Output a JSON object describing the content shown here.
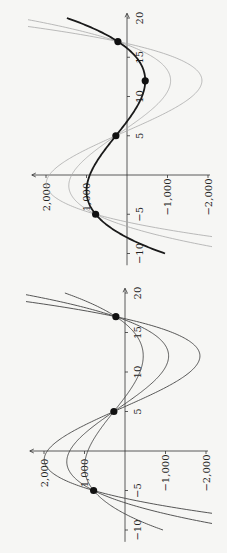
{
  "figure": {
    "background": "#f6f6f4",
    "orientation": "rotated 90 degrees clockwise on page",
    "panels": [
      "left",
      "right"
    ]
  },
  "chart_data": [
    {
      "type": "line",
      "panel": "top-of-page (right panel when upright)",
      "title": "",
      "xlabel": "",
      "ylabel": "",
      "xlim": [
        -10,
        20
      ],
      "ylim": [
        -2000,
        2000
      ],
      "x_ticks": [
        "-10",
        "-5",
        "5",
        "10",
        "15",
        "20"
      ],
      "y_ticks": [
        "2,000",
        "1,000",
        "-1,000",
        "-2,000"
      ],
      "grid": false,
      "series": [
        {
          "name": "cubic c=3.4",
          "color": "#aaaaaa",
          "width": 0.8,
          "c": 3.4
        },
        {
          "name": "cubic c=2.1",
          "color": "#aaaaaa",
          "width": 0.8,
          "c": 2.1
        },
        {
          "name": "cubic through 4 points",
          "color": "#1a1a1a",
          "width": 1.8,
          "c": 1.047,
          "xrange": [
            -10,
            20
          ]
        }
      ],
      "points": [
        {
          "x": -5,
          "y": 775
        },
        {
          "x": 5,
          "y": 275
        },
        {
          "x": 12,
          "y": -450
        },
        {
          "x": 17,
          "y": 225
        }
      ]
    },
    {
      "type": "line",
      "panel": "bottom-of-page (left panel when upright)",
      "title": "",
      "xlabel": "",
      "ylabel": "",
      "xlim": [
        -10,
        20
      ],
      "ylim": [
        -2000,
        2000
      ],
      "x_ticks": [
        "-10",
        "-5",
        "5",
        "10",
        "15",
        "20"
      ],
      "y_ticks": [
        "2,000",
        "1,000",
        "-1,000",
        "-2,000"
      ],
      "grid": false,
      "series": [
        {
          "name": "cubic c=3.4",
          "color": "#444444",
          "width": 0.9,
          "c": 3.4
        },
        {
          "name": "cubic c=2.1",
          "color": "#444444",
          "width": 0.9,
          "c": 2.1
        },
        {
          "name": "cubic c=1.047",
          "color": "#444444",
          "width": 0.9,
          "c": 1.047,
          "xrange": [
            -10,
            20
          ]
        }
      ],
      "points": [
        {
          "x": -5,
          "y": 775
        },
        {
          "x": 5,
          "y": 275
        },
        {
          "x": 17,
          "y": 225
        }
      ]
    }
  ],
  "model": {
    "quadratic": {
      "a": 2.0833,
      "b": -50,
      "d": 472.92
    },
    "roots": [
      -5,
      5,
      17
    ]
  },
  "layout": [
    {
      "axis_x_px": 127,
      "zero_y_px": 175,
      "px_per_unit_x": 7.85,
      "px_per_1000": 40.5,
      "top_px": 14,
      "bottom_px": 265,
      "left_px": 28,
      "right_px": 212
    },
    {
      "axis_x_px": 125,
      "zero_y_px": 451,
      "px_per_unit_x": 7.9,
      "px_per_1000": 40.5,
      "top_px": 288,
      "bottom_px": 545,
      "left_px": 26,
      "right_px": 212
    }
  ]
}
